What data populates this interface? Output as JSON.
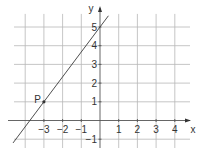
{
  "chart_data": {
    "type": "line",
    "title": "",
    "xlabel": "x",
    "ylabel": "y",
    "xlim": [
      -4.6,
      4.5
    ],
    "ylim": [
      -1.4,
      5.8
    ],
    "x_ticks": [
      -3,
      -2,
      -1,
      1,
      2,
      3,
      4
    ],
    "x_tick_labels": [
      "−3",
      "−2",
      "−1",
      "1",
      "2",
      "3",
      "4"
    ],
    "y_ticks": [
      -1,
      1,
      2,
      3,
      4,
      5
    ],
    "y_tick_labels": [
      "−1",
      "1",
      "2",
      "3",
      "4",
      "5"
    ],
    "grid": true,
    "series": [
      {
        "name": "line",
        "equation": "y = 4/3 x + 5",
        "slope": 1.3333,
        "intercept": 5,
        "x": [
          -4.65,
          0.45
        ],
        "y": [
          -1.2,
          5.6
        ]
      }
    ],
    "points": [
      {
        "label": "P",
        "x": -3,
        "y": 1
      }
    ]
  }
}
